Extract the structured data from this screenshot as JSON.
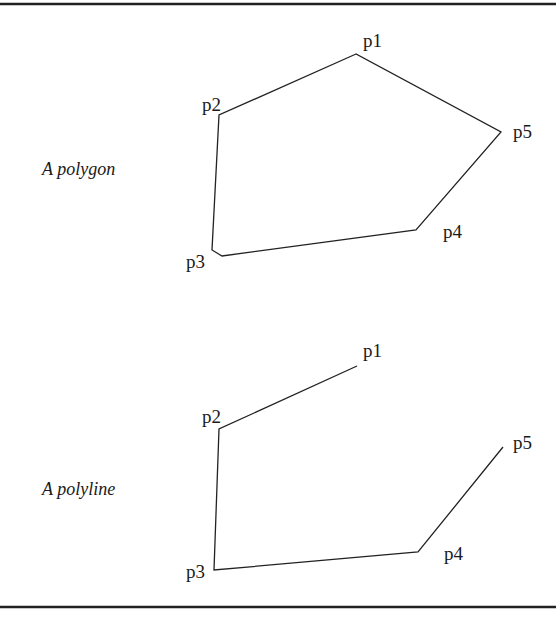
{
  "figure": {
    "rules": {
      "top_y": 4,
      "bottom_y": 607
    },
    "polygon": {
      "caption": "A polygon",
      "caption_pos": [
        42,
        175
      ],
      "closed": true,
      "points": [
        {
          "label": "p1",
          "x": 356,
          "y": 54,
          "label_x": 363,
          "label_y": 47
        },
        {
          "label": "p2",
          "x": 219,
          "y": 115,
          "label_x": 202,
          "label_y": 111
        },
        {
          "label": "p3",
          "x": 212,
          "y": 250,
          "label_x": 186,
          "label_y": 268
        },
        {
          "label": "p4",
          "x": 416,
          "y": 230,
          "label_x": 443,
          "label_y": 238
        },
        {
          "label": "p5",
          "x": 501,
          "y": 132,
          "label_x": 513,
          "label_y": 138
        }
      ],
      "p3_corner_bottom": [
        222,
        256
      ]
    },
    "polyline": {
      "caption": "A polyline",
      "caption_pos": [
        42,
        495
      ],
      "closed": false,
      "points": [
        {
          "label": "p1",
          "x": 357,
          "y": 366,
          "label_x": 363,
          "label_y": 357
        },
        {
          "label": "p2",
          "x": 219,
          "y": 429,
          "label_x": 202,
          "label_y": 423
        },
        {
          "label": "p3",
          "x": 214,
          "y": 570,
          "label_x": 186,
          "label_y": 578
        },
        {
          "label": "p4",
          "x": 418,
          "y": 552,
          "label_x": 444,
          "label_y": 560
        },
        {
          "label": "p5",
          "x": 503,
          "y": 447,
          "label_x": 513,
          "label_y": 449
        }
      ]
    }
  }
}
